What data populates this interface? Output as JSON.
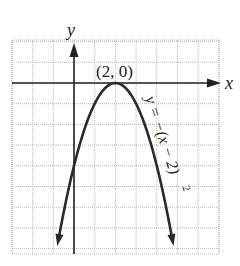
{
  "chart_data": {
    "type": "line",
    "title": "",
    "xlabel": "x",
    "ylabel": "y",
    "equation": "y = -(x - 2)^2",
    "equation_label": "y = −(x − 2)",
    "equation_exponent": "2",
    "vertex": {
      "x": 2,
      "y": 0,
      "label": "(2, 0)"
    },
    "xlim": [
      -3,
      7
    ],
    "ylim": [
      -8.3,
      2
    ],
    "grid": true,
    "grid_step": 1,
    "series": [
      {
        "name": "y = -(x - 2)^2",
        "x": [
          -0.8,
          -0.5,
          0,
          0.5,
          1,
          1.5,
          2,
          2.5,
          3,
          3.5,
          4,
          4.5,
          4.8
        ],
        "y": [
          -7.84,
          -6.25,
          -4,
          -2.25,
          -1,
          -0.25,
          0,
          -0.25,
          -1,
          -2.25,
          -4,
          -6.25,
          -7.84
        ]
      }
    ],
    "colors": {
      "curve": "#2a2a2a",
      "axis": "#222222",
      "grid": "#b8b8b8",
      "background": "#ffffff"
    }
  },
  "labels": {
    "x_axis": "x",
    "y_axis": "y",
    "vertex": "(2, 0)",
    "equation": "y = −(x − 2)",
    "exponent": "2"
  }
}
